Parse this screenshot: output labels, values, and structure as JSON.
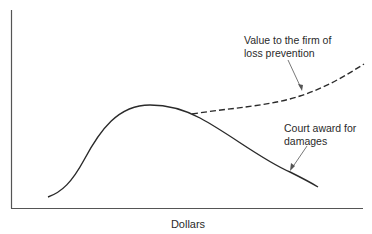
{
  "diagram": {
    "x_axis_label": "Dollars",
    "y_axis_label": "",
    "curves": [
      {
        "name": "Court award for damages",
        "style": "solid",
        "label_lines": [
          "Court award for",
          "damages"
        ],
        "shape": "rises from lower-left to a peak near the middle, then declines toward lower-right"
      },
      {
        "name": "Value to the firm of loss prevention",
        "style": "dashed",
        "label_lines": [
          "Value to the firm of",
          "loss prevention"
        ],
        "shape": "branches off the solid curve just past its peak and rises toward upper-right"
      }
    ],
    "colors": {
      "line": "#2a2a2a",
      "axis": "#555555",
      "background": "#ffffff"
    }
  }
}
